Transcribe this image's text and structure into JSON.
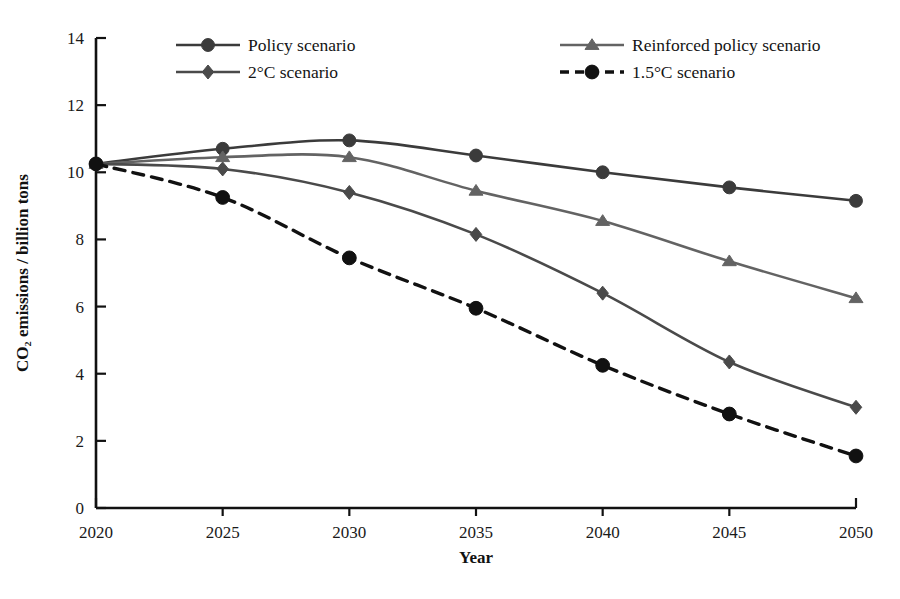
{
  "chart_data": {
    "type": "line",
    "title": "",
    "xlabel": "Year",
    "ylabel": "CO₂ emissions / billion tons",
    "x": [
      2020,
      2025,
      2030,
      2035,
      2040,
      2045,
      2050
    ],
    "xtick_labels": [
      "2020",
      "2025",
      "2030",
      "2035",
      "2040",
      "2045",
      "2050"
    ],
    "ytick_labels": [
      "0",
      "2",
      "4",
      "6",
      "8",
      "10",
      "12",
      "14"
    ],
    "yticks": [
      0,
      2,
      4,
      6,
      8,
      10,
      12,
      14
    ],
    "xlim": [
      2020,
      2050
    ],
    "ylim": [
      0,
      14
    ],
    "grid": false,
    "legend_position": "top-inside",
    "series": [
      {
        "name": "Policy scenario",
        "marker": "circle",
        "dash": false,
        "color": "#3b3b3b",
        "values": [
          10.25,
          10.7,
          10.95,
          10.5,
          10.0,
          9.55,
          9.15
        ]
      },
      {
        "name": "Reinforced policy scenario",
        "marker": "triangle",
        "dash": false,
        "color": "#636363",
        "values": [
          10.25,
          10.45,
          10.45,
          9.45,
          8.55,
          7.35,
          6.25
        ]
      },
      {
        "name": "2°C scenario",
        "marker": "diamond",
        "dash": false,
        "color": "#4a4a4a",
        "values": [
          10.25,
          10.1,
          9.4,
          8.15,
          6.4,
          4.35,
          3.0
        ]
      },
      {
        "name": "1.5°C scenario",
        "marker": "circle",
        "dash": true,
        "color": "#111111",
        "values": [
          10.25,
          9.25,
          7.45,
          5.95,
          4.25,
          2.8,
          1.55
        ]
      }
    ]
  },
  "legend": {
    "entries": [
      {
        "label": "Policy scenario",
        "series_index": 0
      },
      {
        "label": "2°C scenario",
        "series_index": 2
      },
      {
        "label": "Reinforced policy scenario",
        "series_index": 1
      },
      {
        "label": "1.5°C scenario",
        "series_index": 3
      }
    ]
  },
  "axes": {
    "x_title": "Year",
    "y_title": "CO₂ emissions / billion tons"
  },
  "caption": {
    "text": ""
  }
}
